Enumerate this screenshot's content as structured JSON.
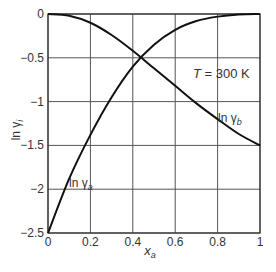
{
  "chart_data": {
    "type": "line",
    "title": "",
    "xlabel": "x_a",
    "ylabel": "ln γ_i",
    "xlim": [
      0,
      1
    ],
    "ylim": [
      -2.5,
      0
    ],
    "grid": true,
    "x_ticks": [
      "0",
      "0.2",
      "0.4",
      "0.6",
      "0.8",
      "1"
    ],
    "y_ticks": [
      "0",
      "-0.5",
      "-1",
      "-1.5",
      "-2",
      "-2.5"
    ],
    "annotation": "T = 300 K",
    "series": [
      {
        "name": "ln γa",
        "x": [
          0,
          0.1,
          0.2,
          0.3,
          0.4,
          0.5,
          0.6,
          0.7,
          0.8,
          0.9,
          1.0
        ],
        "values": [
          -2.5,
          -1.88,
          -1.38,
          -0.95,
          -0.6,
          -0.35,
          -0.18,
          -0.08,
          -0.03,
          -0.005,
          0
        ]
      },
      {
        "name": "ln γb",
        "x": [
          0,
          0.1,
          0.2,
          0.3,
          0.4,
          0.5,
          0.6,
          0.7,
          0.8,
          0.9,
          1.0
        ],
        "values": [
          0,
          -0.02,
          -0.1,
          -0.24,
          -0.42,
          -0.62,
          -0.82,
          -1.02,
          -1.2,
          -1.37,
          -1.5
        ]
      }
    ]
  },
  "labels": {
    "series_a": "ln γ",
    "series_a_sub": "a",
    "series_b": "ln γ",
    "series_b_sub": "b",
    "ylabel": "ln γ",
    "ylabel_sub": "i",
    "xlabel": "x",
    "xlabel_sub": "a",
    "temp_T": "T",
    "temp_rest": " = 300 K"
  }
}
